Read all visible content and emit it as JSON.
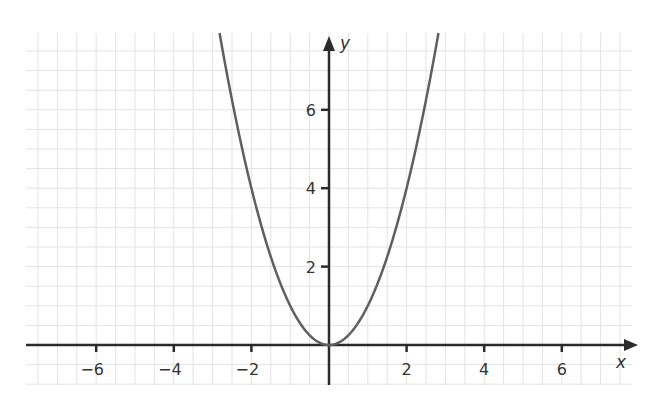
{
  "chart_data": {
    "type": "line",
    "title": "",
    "function": "y = x^2",
    "xlabel": "x",
    "ylabel": "y",
    "xlim": [
      -7.9,
      7.7
    ],
    "ylim": [
      -1.0,
      8.0
    ],
    "x_ticks": [
      -6,
      -4,
      -2,
      2,
      4,
      6
    ],
    "x_tick_labels": [
      "−6",
      "−4",
      "−2",
      "2",
      "4",
      "6"
    ],
    "y_ticks": [
      2,
      4,
      6
    ],
    "y_tick_labels": [
      "2",
      "4",
      "6"
    ],
    "grid": true,
    "grid_step": 0.5,
    "legend": null,
    "series": [
      {
        "name": "y = x²",
        "x": [
          -2.8,
          -2.5,
          -2,
          -1.5,
          -1,
          -0.5,
          0,
          0.5,
          1,
          1.5,
          2,
          2.5,
          2.8
        ],
        "y": [
          7.84,
          6.25,
          4,
          2.25,
          1,
          0.25,
          0,
          0.25,
          1,
          2.25,
          4,
          6.25,
          7.84
        ]
      }
    ]
  },
  "style": {
    "curve_color": "#5f5f5f",
    "axis_color": "#2b2b2b",
    "grid_color": "#e3e3e3",
    "text_color": "#333333"
  }
}
